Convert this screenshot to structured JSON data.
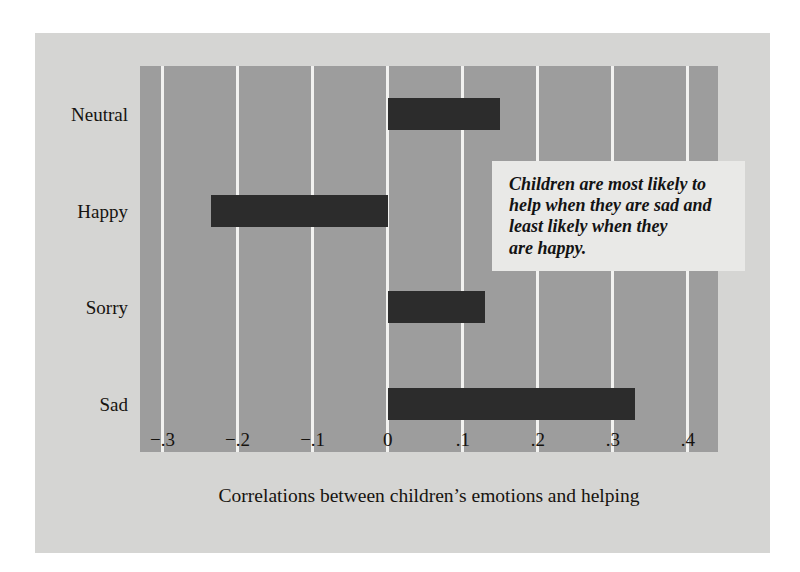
{
  "chart_data": {
    "type": "bar",
    "orientation": "horizontal",
    "title": "",
    "xlabel": "Correlations between children’s emotions and helping",
    "ylabel": "",
    "categories": [
      "Neutral",
      "Happy",
      "Sorry",
      "Sad"
    ],
    "values": [
      0.15,
      -0.235,
      0.13,
      0.33
    ],
    "xlim": [
      -0.33,
      0.44
    ],
    "xticks": [
      -0.3,
      -0.2,
      -0.1,
      0,
      0.1,
      0.2,
      0.3,
      0.4
    ],
    "xticklabels": [
      "−.3",
      "−.2",
      "−.1",
      "0",
      ".1",
      ".2",
      ".3",
      ".4"
    ],
    "grid": "vertical-only",
    "legend": "none",
    "annotations": [
      {
        "text": "Children are most likely to help when they are sad and least likely when they are happy.",
        "style": "bold-italic-callout-box"
      }
    ],
    "colors": {
      "bar": "#2c2c2c",
      "plot_background": "#9d9d9d",
      "figure_background": "#d5d5d3",
      "gridline": "#f2f2f0",
      "annotation_background": "#e9e9e7",
      "text": "#16130f"
    }
  },
  "annotation": {
    "line1": "Children are most likely to",
    "line2": "help when they are sad and",
    "line3": "least likely when they",
    "line4": "are happy."
  }
}
